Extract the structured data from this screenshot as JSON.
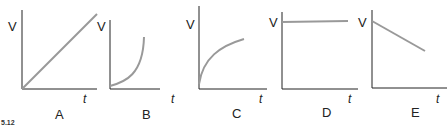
{
  "figure_label": "5.12",
  "colors": {
    "axis": "#222222",
    "curve": "#999999",
    "text": "#222222"
  },
  "panels": [
    {
      "id": "A",
      "caption": "A",
      "ylabel": "V",
      "xlabel": "t",
      "shape": "linear-increasing"
    },
    {
      "id": "B",
      "caption": "B",
      "ylabel": "V",
      "xlabel": "t",
      "shape": "exponential-increasing"
    },
    {
      "id": "C",
      "caption": "C",
      "ylabel": "V",
      "xlabel": "t",
      "shape": "logarithmic-increasing"
    },
    {
      "id": "D",
      "caption": "D",
      "ylabel": "V",
      "xlabel": "t",
      "shape": "constant"
    },
    {
      "id": "E",
      "caption": "E",
      "ylabel": "V",
      "xlabel": "t",
      "shape": "linear-decreasing"
    }
  ]
}
